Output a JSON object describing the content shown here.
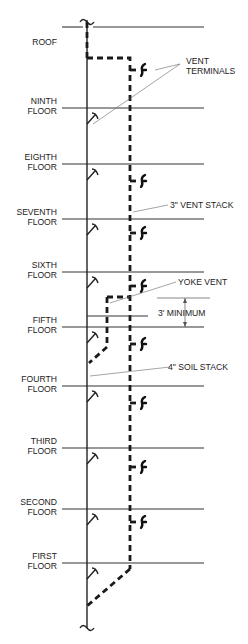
{
  "diagram": {
    "floors": [
      {
        "line1": "ROOF",
        "line2": ""
      },
      {
        "line1": "NINTH",
        "line2": "FLOOR"
      },
      {
        "line1": "EIGHTH",
        "line2": "FLOOR"
      },
      {
        "line1": "SEVENTH",
        "line2": "FLOOR"
      },
      {
        "line1": "SIXTH",
        "line2": "FLOOR"
      },
      {
        "line1": "FIFTH",
        "line2": "FLOOR"
      },
      {
        "line1": "FOURTH",
        "line2": "FLOOR"
      },
      {
        "line1": "THIRD",
        "line2": "FLOOR"
      },
      {
        "line1": "SECOND",
        "line2": "FLOOR"
      },
      {
        "line1": "FIRST",
        "line2": "FLOOR"
      }
    ],
    "annotations": {
      "vent_terminals_1": "VENT",
      "vent_terminals_2": "TERMINALS",
      "vent_stack": "3\" VENT STACK",
      "yoke_vent": "YOKE VENT",
      "minimum": "3' MINIMUM",
      "soil_stack": "4\" SOIL STACK"
    }
  }
}
